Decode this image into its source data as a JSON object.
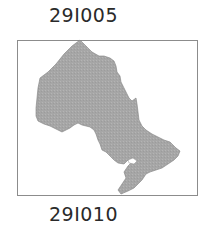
{
  "labels": {
    "top": "29I005",
    "bottom": "29I010"
  },
  "map": {
    "region": "Ontario",
    "fill_color": "#a9a9a9",
    "outline_color": "#7a7a7a",
    "frame_color": "#8c8c8c"
  }
}
